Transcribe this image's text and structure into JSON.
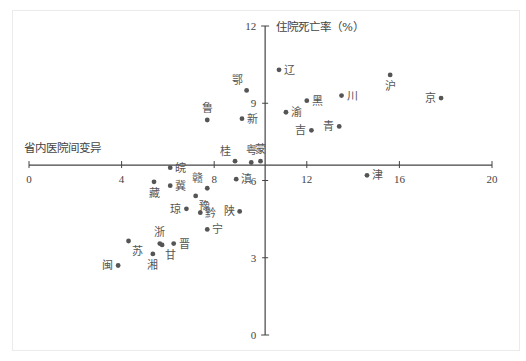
{
  "chart_data": {
    "type": "scatter",
    "title": "",
    "xlabel": "省内医院间变异",
    "ylabel": "住院死亡率（%）",
    "xlim": [
      0,
      20
    ],
    "ylim": [
      0,
      12
    ],
    "x_ticks": [
      0,
      4,
      8,
      12,
      16,
      20
    ],
    "y_ticks": [
      0,
      3,
      6,
      9,
      12
    ],
    "x_axis_crosses_y_at": 6.6,
    "y_axis_crosses_x_at": 10.2,
    "grid": false,
    "legend": null,
    "points": [
      {
        "label": "辽",
        "x": 10.8,
        "y": 10.3,
        "label_pos": "right"
      },
      {
        "label": "沪",
        "x": 15.6,
        "y": 10.1,
        "label_pos": "below"
      },
      {
        "label": "京",
        "x": 17.8,
        "y": 9.2,
        "label_pos": "left"
      },
      {
        "label": "鄂",
        "x": 9.4,
        "y": 9.5,
        "label_pos": "above-left"
      },
      {
        "label": "黑",
        "x": 12.0,
        "y": 9.1,
        "label_pos": "right"
      },
      {
        "label": "川",
        "x": 13.5,
        "y": 9.3,
        "label_pos": "right"
      },
      {
        "label": "鲁",
        "x": 7.7,
        "y": 8.35,
        "label_pos": "above"
      },
      {
        "label": "新",
        "x": 9.2,
        "y": 8.4,
        "label_pos": "right"
      },
      {
        "label": "渝",
        "x": 11.1,
        "y": 8.65,
        "label_pos": "right"
      },
      {
        "label": "青",
        "x": 13.4,
        "y": 8.1,
        "label_pos": "left"
      },
      {
        "label": "吉",
        "x": 12.2,
        "y": 7.95,
        "label_pos": "left"
      },
      {
        "label": "桂",
        "x": 8.9,
        "y": 6.75,
        "label_pos": "above-left"
      },
      {
        "label": "粤",
        "x": 9.6,
        "y": 6.7,
        "label_pos": "above"
      },
      {
        "label": "蒙",
        "x": 10.0,
        "y": 6.75,
        "label_pos": "above"
      },
      {
        "label": "皖",
        "x": 6.1,
        "y": 6.5,
        "label_pos": "right"
      },
      {
        "label": "滇",
        "x": 8.95,
        "y": 6.05,
        "label_pos": "right"
      },
      {
        "label": "津",
        "x": 14.6,
        "y": 6.2,
        "label_pos": "right"
      },
      {
        "label": "藏",
        "x": 5.4,
        "y": 5.95,
        "label_pos": "below"
      },
      {
        "label": "冀",
        "x": 6.1,
        "y": 5.8,
        "label_pos": "right"
      },
      {
        "label": "赣",
        "x": 7.7,
        "y": 5.7,
        "label_pos": "above-left"
      },
      {
        "label": "豫",
        "x": 7.2,
        "y": 5.4,
        "label_pos": "below-right"
      },
      {
        "label": "琼",
        "x": 6.8,
        "y": 4.9,
        "label_pos": "left"
      },
      {
        "label": "黔",
        "x": 7.4,
        "y": 4.75,
        "label_pos": "right"
      },
      {
        "label": "陕",
        "x": 9.1,
        "y": 4.8,
        "label_pos": "left"
      },
      {
        "label": "宁",
        "x": 7.7,
        "y": 4.1,
        "label_pos": "right"
      },
      {
        "label": "浙",
        "x": 5.65,
        "y": 3.55,
        "label_pos": "above"
      },
      {
        "label": "甘",
        "x": 5.75,
        "y": 3.5,
        "label_pos": "below-right"
      },
      {
        "label": "晋",
        "x": 6.25,
        "y": 3.55,
        "label_pos": "right"
      },
      {
        "label": "苏",
        "x": 4.3,
        "y": 3.65,
        "label_pos": "below-right"
      },
      {
        "label": "湘",
        "x": 5.35,
        "y": 3.15,
        "label_pos": "below"
      },
      {
        "label": "闽",
        "x": 3.85,
        "y": 2.7,
        "label_pos": "left"
      }
    ]
  },
  "colors": {
    "point": "#555555",
    "axis": "#444444",
    "text": "#444444",
    "border": "#ebebeb"
  }
}
